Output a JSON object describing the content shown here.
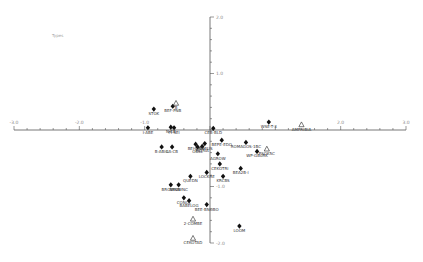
{
  "chart_data": {
    "type": "scatter",
    "title": "Types",
    "xlabel": "",
    "ylabel": "",
    "xlim": [
      -3.0,
      3.0
    ],
    "ylim": [
      -2.0,
      2.0
    ],
    "grid": false,
    "legend": null,
    "x_ticks": [
      -3.0,
      -2.0,
      -1.0,
      2.0,
      3.0
    ],
    "x_tick_labels": [
      "-3.0",
      "-2.0",
      "-1.0",
      "2.0",
      "3.0"
    ],
    "y_ticks": [
      2.0,
      1.0,
      -1.0,
      -2.0
    ],
    "y_tick_labels": [
      "2.0",
      "1.0",
      "-1.0",
      "-2.0"
    ],
    "marker_types": {
      "filled": "black diamond",
      "open": "open triangle"
    },
    "points": [
      {
        "label": "STOK",
        "x": -0.86,
        "y": 0.37,
        "marker": "filled"
      },
      {
        "label": "BEF-PNB",
        "x": -0.57,
        "y": 0.42,
        "marker": "filled"
      },
      {
        "label": "B",
        "x": -0.52,
        "y": 0.47,
        "marker": "open"
      },
      {
        "label": "I-ABE",
        "x": -0.95,
        "y": 0.04,
        "marker": "filled"
      },
      {
        "label": "N-EB",
        "x": -0.6,
        "y": 0.05,
        "marker": "filled"
      },
      {
        "label": "FI-SEI",
        "x": -0.55,
        "y": 0.04,
        "marker": "filled"
      },
      {
        "label": "CEB-BLD",
        "x": 0.05,
        "y": 0.03,
        "marker": "filled"
      },
      {
        "label": "WSE-T-3",
        "x": 0.9,
        "y": 0.14,
        "marker": "filled"
      },
      {
        "label": "AMPHIBIA",
        "x": 1.4,
        "y": 0.09,
        "marker": "open"
      },
      {
        "label": "B-ABIG",
        "x": -0.74,
        "y": -0.3,
        "marker": "filled"
      },
      {
        "label": "LA-CB",
        "x": -0.58,
        "y": -0.3,
        "marker": "filled"
      },
      {
        "label": "BEHPRE",
        "x": -0.22,
        "y": -0.25,
        "marker": "filled"
      },
      {
        "label": "OBSL",
        "x": -0.19,
        "y": -0.3,
        "marker": "filled"
      },
      {
        "label": "PIGRIA",
        "x": -0.12,
        "y": -0.29,
        "marker": "filled"
      },
      {
        "label": "HEMIUS",
        "x": -0.08,
        "y": -0.24,
        "marker": "filled"
      },
      {
        "label": "BEPE-EDO",
        "x": 0.18,
        "y": -0.18,
        "marker": "filled"
      },
      {
        "label": "ROMAGOS-1BC",
        "x": 0.55,
        "y": -0.22,
        "marker": "filled"
      },
      {
        "label": "AGROW",
        "x": 0.12,
        "y": -0.42,
        "marker": "filled"
      },
      {
        "label": "WP-GB0RK",
        "x": 0.72,
        "y": -0.38,
        "marker": "filled"
      },
      {
        "label": "PSOK5C",
        "x": 0.87,
        "y": -0.34,
        "marker": "open"
      },
      {
        "label": "CEKOTRI",
        "x": 0.15,
        "y": -0.6,
        "marker": "filled"
      },
      {
        "label": "BEA2B-I",
        "x": 0.47,
        "y": -0.68,
        "marker": "filled"
      },
      {
        "label": "LOCKRE",
        "x": -0.05,
        "y": -0.75,
        "marker": "filled"
      },
      {
        "label": "QUEDN",
        "x": -0.3,
        "y": -0.82,
        "marker": "filled"
      },
      {
        "label": "KRCBS",
        "x": 0.2,
        "y": -0.82,
        "marker": "filled"
      },
      {
        "label": "BROWNB",
        "x": -0.6,
        "y": -0.97,
        "marker": "filled"
      },
      {
        "label": "BROWNC",
        "x": -0.48,
        "y": -0.97,
        "marker": "filled"
      },
      {
        "label": "CONOL",
        "x": -0.4,
        "y": -1.2,
        "marker": "filled"
      },
      {
        "label": "BABELOG",
        "x": -0.32,
        "y": -1.25,
        "marker": "filled"
      },
      {
        "label": "BEE-BNOBO",
        "x": -0.05,
        "y": -1.32,
        "marker": "filled"
      },
      {
        "label": "LOOM",
        "x": 0.45,
        "y": -1.7,
        "marker": "filled"
      },
      {
        "label": "2-COMBE",
        "x": -0.26,
        "y": -1.58,
        "marker": "open"
      },
      {
        "label": "CEKOTAD",
        "x": -0.26,
        "y": -1.92,
        "marker": "open"
      }
    ]
  },
  "plot_area": {
    "x_axis_y_px": 130,
    "y_axis_x_px": 210,
    "x_min_px": 13,
    "x_max_px": 405,
    "y_top_px": 17,
    "y_bottom_px": 243
  }
}
